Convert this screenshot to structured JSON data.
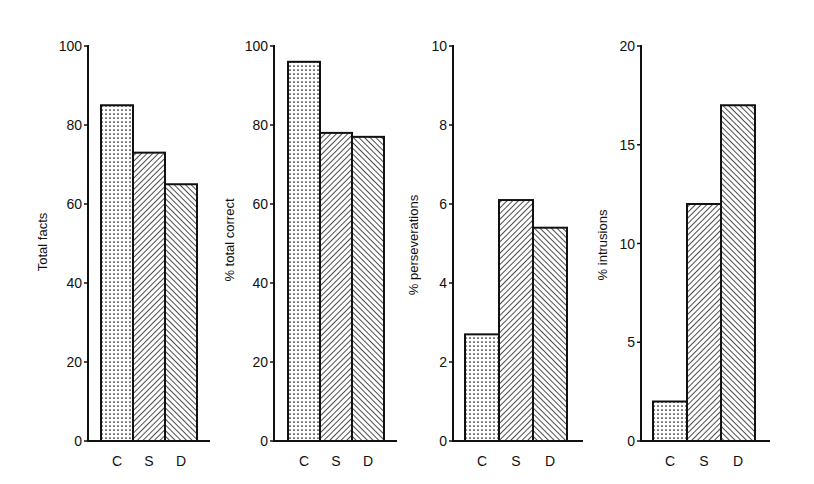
{
  "figure": {
    "background": "#ffffff",
    "ink": "#111111"
  },
  "chart_data": [
    {
      "type": "bar",
      "title": "",
      "xlabel": "",
      "ylabel": "Total facts",
      "categories": [
        "C",
        "S",
        "D"
      ],
      "values": [
        85,
        73,
        65
      ],
      "ylim": [
        0,
        100
      ],
      "yticks": [
        0,
        20,
        40,
        60,
        80,
        100
      ],
      "patterns": [
        "dots",
        "hatch-back",
        "hatch-forward"
      ],
      "grid": false,
      "legend": null
    },
    {
      "type": "bar",
      "title": "",
      "xlabel": "",
      "ylabel": "% total correct",
      "categories": [
        "C",
        "S",
        "D"
      ],
      "values": [
        96,
        78,
        77
      ],
      "ylim": [
        0,
        100
      ],
      "yticks": [
        0,
        20,
        40,
        60,
        80,
        100
      ],
      "patterns": [
        "dots",
        "hatch-back",
        "hatch-forward"
      ],
      "grid": false,
      "legend": null
    },
    {
      "type": "bar",
      "title": "",
      "xlabel": "",
      "ylabel": "% perseverations",
      "categories": [
        "C",
        "S",
        "D"
      ],
      "values": [
        2.7,
        6.1,
        5.4
      ],
      "ylim": [
        0,
        10
      ],
      "yticks": [
        0,
        2,
        4,
        6,
        8,
        10
      ],
      "patterns": [
        "dots",
        "hatch-back",
        "hatch-forward"
      ],
      "grid": false,
      "legend": null
    },
    {
      "type": "bar",
      "title": "",
      "xlabel": "",
      "ylabel": "% intrusions",
      "categories": [
        "C",
        "S",
        "D"
      ],
      "values": [
        2,
        12,
        17
      ],
      "ylim": [
        0,
        20
      ],
      "yticks": [
        0,
        5,
        10,
        15,
        20
      ],
      "patterns": [
        "dots",
        "hatch-back",
        "hatch-forward"
      ],
      "grid": false,
      "legend": null
    }
  ],
  "panels": [
    {
      "axis_x": 88,
      "axis_end": 210,
      "bar_x": [
        101,
        133,
        165
      ],
      "bar_w": 32,
      "ylabel_x": 47,
      "ylabel_y": 242,
      "tick_label_x": 82
    },
    {
      "axis_x": 274,
      "axis_end": 397,
      "bar_x": [
        288,
        320,
        352
      ],
      "bar_w": 32,
      "ylabel_x": 234,
      "ylabel_y": 240,
      "tick_label_x": 268
    },
    {
      "axis_x": 453,
      "axis_end": 583,
      "bar_x": [
        465,
        499,
        533
      ],
      "bar_w": 34,
      "ylabel_x": 418,
      "ylabel_y": 245,
      "tick_label_x": 447
    },
    {
      "axis_x": 641,
      "axis_end": 770,
      "bar_x": [
        653,
        687,
        721
      ],
      "bar_w": 34,
      "ylabel_x": 607,
      "ylabel_y": 245,
      "tick_label_x": 635
    }
  ],
  "layout": {
    "y_top": 46,
    "y_base": 441,
    "cat_label_y": 466
  }
}
